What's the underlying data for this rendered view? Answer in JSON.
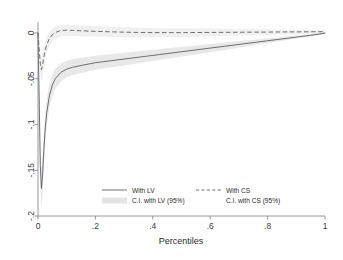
{
  "chart_data": {
    "type": "line",
    "title": "",
    "subtitle": "",
    "xlabel": "Percentiles",
    "ylabel": "",
    "xlim": [
      0,
      1
    ],
    "ylim": [
      -0.2,
      0.012
    ],
    "grid": false,
    "legend_position": "bottom-inside",
    "x_ticks": [
      "0",
      ".2",
      ".4",
      ".6",
      ".8",
      "1"
    ],
    "x_tick_values": [
      0,
      0.2,
      0.4,
      0.6,
      0.8,
      1
    ],
    "y_ticks": [
      "0",
      "-.05",
      "-.1",
      "-.15",
      "-.2"
    ],
    "y_tick_values": [
      0,
      -0.05,
      -0.1,
      -0.15,
      -0.2
    ],
    "x": [
      0,
      0.004,
      0.008,
      0.012,
      0.016,
      0.02,
      0.025,
      0.03,
      0.04,
      0.05,
      0.06,
      0.08,
      0.1,
      0.12,
      0.15,
      0.2,
      0.25,
      0.3,
      0.35,
      0.4,
      0.45,
      0.5,
      0.55,
      0.6,
      0.65,
      0.7,
      0.75,
      0.8,
      0.85,
      0.9,
      0.95,
      0.98,
      1
    ],
    "series": [
      {
        "name": "With LV",
        "style": "solid",
        "values": [
          0,
          -0.07,
          -0.145,
          -0.17,
          -0.155,
          -0.13,
          -0.105,
          -0.088,
          -0.068,
          -0.057,
          -0.05,
          -0.043,
          -0.0395,
          -0.0375,
          -0.0355,
          -0.0325,
          -0.0305,
          -0.0285,
          -0.0265,
          -0.0245,
          -0.0225,
          -0.0205,
          -0.0185,
          -0.0165,
          -0.0145,
          -0.0125,
          -0.0105,
          -0.0085,
          -0.0065,
          -0.0045,
          -0.0025,
          -0.0012,
          0
        ]
      },
      {
        "name": "With CS",
        "style": "dashed",
        "values": [
          0,
          -0.017,
          -0.034,
          -0.04,
          -0.035,
          -0.027,
          -0.019,
          -0.013,
          -0.006,
          -0.002,
          0.0005,
          0.0028,
          0.003,
          0.0028,
          0.0024,
          0.0018,
          0.0013,
          0.0009,
          0.0006,
          0.0004,
          0.0004,
          0.0004,
          0.0005,
          0.0006,
          0.0007,
          0.0008,
          0.0009,
          0.001,
          0.0011,
          0.0012,
          0.0013,
          0.0014,
          0.0015
        ]
      }
    ],
    "ci_bands": [
      {
        "name": "C.I. with LV (95%)",
        "for_series": "With LV",
        "lower": [
          0,
          -0.086,
          -0.165,
          -0.192,
          -0.176,
          -0.149,
          -0.122,
          -0.103,
          -0.081,
          -0.069,
          -0.061,
          -0.053,
          -0.0485,
          -0.0462,
          -0.0438,
          -0.0402,
          -0.0378,
          -0.0354,
          -0.033,
          -0.0306,
          -0.0282,
          -0.0258,
          -0.0234,
          -0.021,
          -0.0186,
          -0.0162,
          -0.0135,
          -0.011,
          -0.0086,
          -0.0062,
          -0.0038,
          -0.0022,
          -0.0009
        ],
        "upper": [
          0,
          -0.054,
          -0.125,
          -0.148,
          -0.134,
          -0.111,
          -0.088,
          -0.073,
          -0.055,
          -0.045,
          -0.039,
          -0.033,
          -0.0305,
          -0.0288,
          -0.0272,
          -0.0248,
          -0.0232,
          -0.0216,
          -0.02,
          -0.0184,
          -0.0168,
          -0.0152,
          -0.0136,
          -0.012,
          -0.0104,
          -0.0088,
          -0.0075,
          -0.006,
          -0.0044,
          -0.0028,
          -0.0012,
          -0.0002,
          0.0009
        ]
      },
      {
        "name": "C.I. with CS (95%)",
        "for_series": "With CS",
        "lower": [
          0,
          -0.026,
          -0.047,
          -0.053,
          -0.047,
          -0.038,
          -0.029,
          -0.022,
          -0.014,
          -0.009,
          -0.0062,
          -0.0035,
          -0.0031,
          -0.0032,
          -0.0035,
          -0.004,
          -0.0043,
          -0.0045,
          -0.0046,
          -0.0046,
          -0.0045,
          -0.0043,
          -0.004,
          -0.0037,
          -0.0033,
          -0.0029,
          -0.0025,
          -0.0021,
          -0.0017,
          -0.0013,
          -0.0008,
          -0.0005,
          -0.0002
        ],
        "upper": [
          0,
          -0.008,
          -0.021,
          -0.027,
          -0.023,
          -0.016,
          -0.009,
          -0.004,
          0.002,
          0.005,
          0.0072,
          0.0091,
          0.0091,
          0.0088,
          0.0083,
          0.0076,
          0.0069,
          0.0063,
          0.0058,
          0.0054,
          0.0053,
          0.0051,
          0.005,
          0.0049,
          0.0047,
          0.0045,
          0.0043,
          0.0041,
          0.0039,
          0.0037,
          0.0034,
          0.0033,
          0.0032
        ]
      }
    ],
    "legend": [
      {
        "label": "With LV",
        "style": "solid"
      },
      {
        "label": "With CS",
        "style": "dashed"
      },
      {
        "label": "C.I. with LV (95%)",
        "style": "band"
      },
      {
        "label": "C.I. with CS (95%)",
        "style": "band"
      }
    ]
  }
}
